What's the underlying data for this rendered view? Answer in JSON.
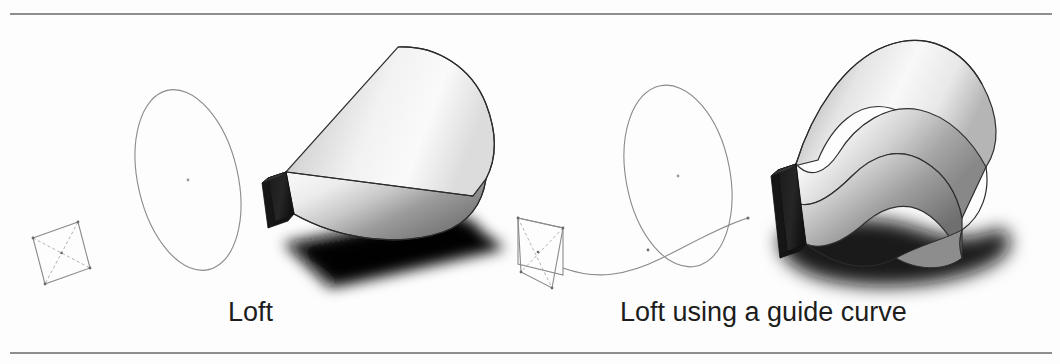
{
  "page": {
    "background_color": "#fdfdfd",
    "rules": {
      "color": "#8e8e8e",
      "top_label": "top-divider-rule",
      "bottom_label": "bottom-divider-rule"
    }
  },
  "figures": [
    {
      "id": "loft-basic",
      "caption": "Loft",
      "profile_sketch": "rectangular-profile-parallelogram",
      "second_profile": "ellipse-sketch",
      "result_solid": "lofted-solid-rect-to-ellipse",
      "has_guide_curve": false
    },
    {
      "id": "loft-guide-curve",
      "caption": "Loft using a guide curve",
      "profile_sketch": "rectangular-profile-parallelogram",
      "second_profile": "ellipse-sketch",
      "guide_curve": "s-shaped-guide-curve",
      "result_solid": "lofted-solid-s-curved",
      "has_guide_curve": true
    }
  ],
  "captions": {
    "left": "Loft",
    "right": "Loft using a guide curve"
  },
  "colors": {
    "rule": "#8e8e8e",
    "sketch_line": "#7a7a7a",
    "outline": "#2b2b2b",
    "dark_face": "#1c1c1c",
    "shadow": "#101010",
    "text": "#1d1d1d",
    "background": "#fdfdfd"
  }
}
